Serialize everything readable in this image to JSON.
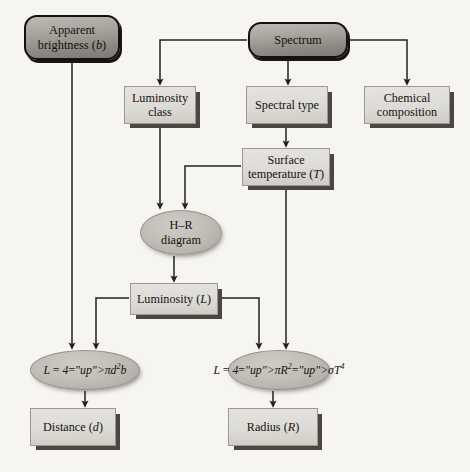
{
  "diagram": {
    "background_color": "#f7f5f2",
    "line_color": "#23201d",
    "nodes": [
      {
        "id": "apparent-brightness",
        "label_line1": "Apparent",
        "label_line2": "brightness (b)",
        "shape": "rounded-capsule",
        "fill": "#a8a39d",
        "x": 24,
        "y": 15,
        "w": 96,
        "h": 45
      },
      {
        "id": "spectrum",
        "label_line1": "Spectrum",
        "label_line2": "",
        "shape": "rounded-capsule",
        "fill": "#a8a39d",
        "x": 248,
        "y": 22,
        "w": 100,
        "h": 36
      },
      {
        "id": "luminosity-class",
        "label_line1": "Luminosity",
        "label_line2": "class",
        "shape": "slab",
        "fill": "#ddd9d4",
        "x": 124,
        "y": 86,
        "w": 72,
        "h": 38
      },
      {
        "id": "spectral-type",
        "label_line1": "Spectral type",
        "label_line2": "",
        "shape": "slab",
        "fill": "#ddd9d4",
        "x": 246,
        "y": 86,
        "w": 82,
        "h": 38
      },
      {
        "id": "chemical-composition",
        "label_line1": "Chemical",
        "label_line2": "composition",
        "shape": "slab",
        "fill": "#ddd9d4",
        "x": 364,
        "y": 86,
        "w": 86,
        "h": 38
      },
      {
        "id": "surface-temperature",
        "label_line1": "Surface",
        "label_line2": "temperature (T)",
        "shape": "slab",
        "fill": "#ddd9d4",
        "x": 242,
        "y": 148,
        "w": 88,
        "h": 38
      },
      {
        "id": "hr-diagram",
        "label_line1": "H–R",
        "label_line2": "diagram",
        "shape": "ellipse",
        "fill": "#bcb8b2",
        "x": 140,
        "y": 210,
        "w": 82,
        "h": 45
      },
      {
        "id": "luminosity",
        "label_line1": "Luminosity (L)",
        "label_line2": "",
        "shape": "slab",
        "fill": "#ddd9d4",
        "x": 130,
        "y": 283,
        "w": 88,
        "h": 32
      },
      {
        "id": "formula-distance",
        "label_formula": "L = 4πd²b",
        "shape": "ellipse",
        "fill": "#bcb8b2",
        "x": 30,
        "y": 350,
        "w": 110,
        "h": 40
      },
      {
        "id": "formula-radius",
        "label_formula": "L = 4πR²σT⁴",
        "shape": "ellipse",
        "fill": "#bcb8b2",
        "x": 228,
        "y": 350,
        "w": 102,
        "h": 40
      },
      {
        "id": "distance",
        "label_line1": "Distance (d)",
        "label_line2": "",
        "shape": "slab",
        "fill": "#ddd9d4",
        "x": 30,
        "y": 408,
        "w": 86,
        "h": 38
      },
      {
        "id": "radius",
        "label_line1": "Radius (R)",
        "label_line2": "",
        "shape": "slab",
        "fill": "#ddd9d4",
        "x": 228,
        "y": 408,
        "w": 90,
        "h": 38
      }
    ],
    "edges": [
      {
        "from": "apparent-brightness",
        "to": "formula-distance"
      },
      {
        "from": "spectrum",
        "to": "luminosity-class"
      },
      {
        "from": "spectrum",
        "to": "spectral-type"
      },
      {
        "from": "spectrum",
        "to": "chemical-composition"
      },
      {
        "from": "spectral-type",
        "to": "surface-temperature"
      },
      {
        "from": "luminosity-class",
        "to": "hr-diagram"
      },
      {
        "from": "surface-temperature",
        "to": "hr-diagram"
      },
      {
        "from": "surface-temperature",
        "to": "formula-radius"
      },
      {
        "from": "hr-diagram",
        "to": "luminosity"
      },
      {
        "from": "luminosity",
        "to": "formula-distance"
      },
      {
        "from": "luminosity",
        "to": "formula-radius"
      },
      {
        "from": "formula-distance",
        "to": "distance"
      },
      {
        "from": "formula-radius",
        "to": "radius"
      }
    ]
  }
}
